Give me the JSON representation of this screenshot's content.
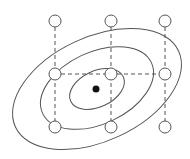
{
  "diagram": {
    "colors": {
      "stroke": "#555555",
      "optimum": "#111111",
      "background": "#ffffff"
    },
    "center": {
      "x": 96,
      "y": 89
    },
    "contours": [
      {
        "name": "outer",
        "cx": 97,
        "cy": 89,
        "rx": 90,
        "ry": 52,
        "rotate": -25
      },
      {
        "name": "middle",
        "cx": 97,
        "cy": 88,
        "rx": 60,
        "ry": 36,
        "rotate": -25
      },
      {
        "name": "inner",
        "cx": 97,
        "cy": 89,
        "rx": 29,
        "ry": 18,
        "rotate": -25
      }
    ],
    "grid": {
      "columns_x": [
        55,
        111,
        165
      ],
      "rows_y": [
        21,
        74,
        127
      ],
      "point_radius": 6
    },
    "optimum_point": {
      "x": 96,
      "y": 89,
      "r": 3.5
    }
  }
}
